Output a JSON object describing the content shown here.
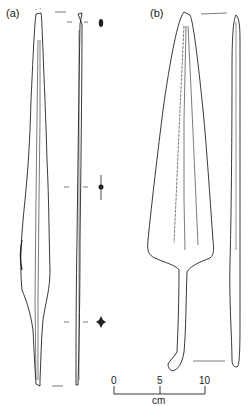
{
  "figure": {
    "panels": [
      {
        "id": "a",
        "label": "(a)",
        "description": "long narrow spearhead, face view, side view, and three cross-sections"
      },
      {
        "id": "b",
        "label": "(b)",
        "description": "leaf-shaped spearhead with tang and hooked end, face and side view"
      }
    ],
    "scale_bar": {
      "ticks": [
        "0",
        "5",
        "10"
      ],
      "unit": "cm"
    },
    "line_color": "#222222",
    "background": "#ffffff"
  }
}
